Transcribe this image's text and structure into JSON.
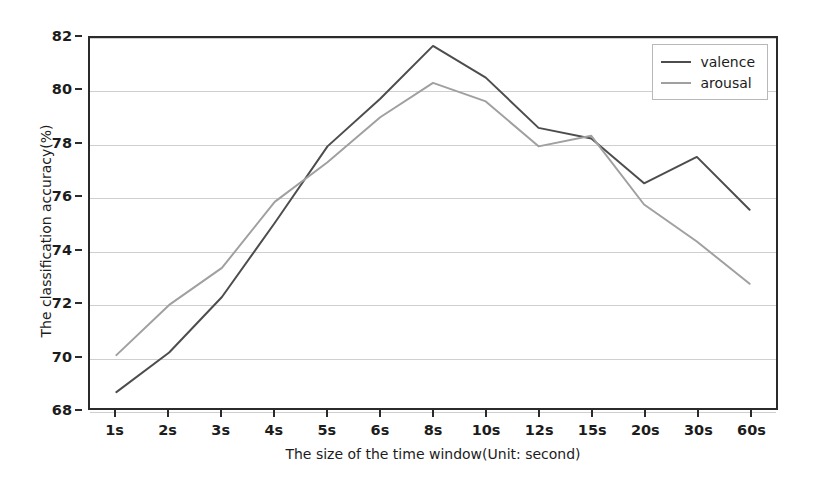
{
  "chart_data": {
    "type": "line",
    "title": "",
    "xlabel": "The size of the time window(Unit: second)",
    "ylabel": "The classification accuracy(%)",
    "categories": [
      "1s",
      "2s",
      "3s",
      "4s",
      "5s",
      "6s",
      "8s",
      "10s",
      "12s",
      "15s",
      "20s",
      "30s",
      "60s"
    ],
    "series": [
      {
        "name": "valence",
        "color": "#4d4d4d",
        "values": [
          68.6,
          70.1,
          72.2,
          75.0,
          77.9,
          79.7,
          81.7,
          80.5,
          78.6,
          78.2,
          76.5,
          77.5,
          75.5
        ]
      },
      {
        "name": "arousal",
        "color": "#a0a0a0",
        "values": [
          70.0,
          71.9,
          73.3,
          75.8,
          77.3,
          79.0,
          80.3,
          79.6,
          77.9,
          78.3,
          75.7,
          74.3,
          72.7
        ]
      }
    ],
    "ylim": [
      68,
      82
    ],
    "yticks": [
      68,
      70,
      72,
      74,
      76,
      78,
      80,
      82
    ],
    "ytick_labels": [
      "68",
      "70",
      "72",
      "74",
      "76",
      "78",
      "80",
      "82"
    ],
    "grid": true,
    "grid_axis": "y",
    "legend_position": "upper right"
  },
  "axes": {
    "frame_color": "#2b2b2b",
    "grid_color": "#cfcfcf"
  }
}
